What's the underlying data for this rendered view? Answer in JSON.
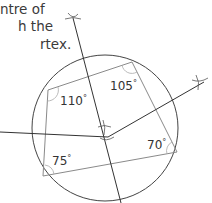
{
  "caption": {
    "lines": [
      "ntre of",
      "h the",
      "rtex."
    ]
  },
  "figure": {
    "circle": {
      "cx": 105,
      "cy": 128,
      "r": 73,
      "stroke": "#444444"
    },
    "quadrilateral": {
      "stroke": "#8a8a8a",
      "vertices": [
        [
          48,
          90
        ],
        [
          132,
          62
        ],
        [
          177,
          152
        ],
        [
          43,
          176
        ]
      ]
    },
    "bisectors": {
      "stroke": "#333333",
      "lines": [
        [
          73,
          18,
          121,
          203
        ],
        [
          0,
          132,
          108,
          137
        ],
        [
          108,
          137,
          204,
          82
        ]
      ]
    },
    "angles": [
      {
        "label": "110",
        "unit": "°",
        "x": 60,
        "y": 95
      },
      {
        "label": "105",
        "unit": "°",
        "x": 110,
        "y": 80
      },
      {
        "label": "70",
        "unit": "°",
        "x": 147,
        "y": 139
      },
      {
        "label": "75",
        "unit": "°",
        "x": 52,
        "y": 155
      }
    ]
  }
}
